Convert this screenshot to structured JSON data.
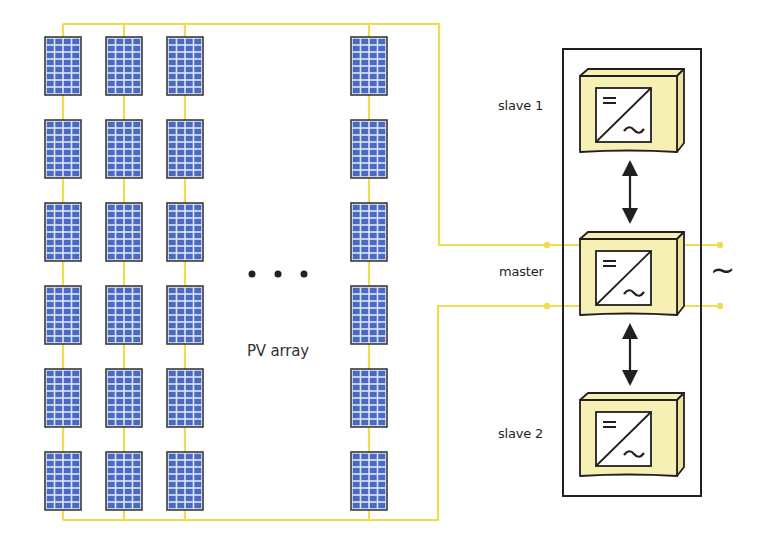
{
  "labels": {
    "pv_array": "PV array",
    "ellipsis": "• • •",
    "slave1": "slave 1",
    "master": "master",
    "slave2": "slave 2",
    "ac_output": "~"
  },
  "inverter_symbol": {
    "dc": "=",
    "ac": "~"
  },
  "pv_array": {
    "strings_visible": 4,
    "modules_per_string": 6,
    "module_cells": {
      "columns": 4,
      "rows": 8
    },
    "string_x_positions": [
      45,
      106,
      167,
      351
    ],
    "row_y_positions": [
      37,
      120,
      203,
      286,
      369,
      452
    ]
  },
  "inverters": [
    {
      "name": "slave 1",
      "role": "slave"
    },
    {
      "name": "master",
      "role": "master"
    },
    {
      "name": "slave 2",
      "role": "slave"
    }
  ],
  "colors": {
    "wire": "#f0dc50",
    "module_fill": "#4a6ac2",
    "module_grid": "#dce4f6",
    "module_border": "#3a3a3a",
    "inverter_fill": "#f7f0b4",
    "inverter_side": "#efe39a",
    "outline": "#231f20"
  }
}
